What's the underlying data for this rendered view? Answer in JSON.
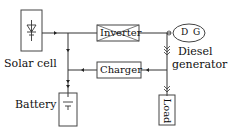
{
  "diagram": {
    "type": "hybrid power system block diagram",
    "components": {
      "solar_cell": {
        "label": "Solar cell"
      },
      "inverter": {
        "label": "Inverter"
      },
      "charger": {
        "label": "Charger"
      },
      "diesel_generator": {
        "symbol": "D G",
        "label_line1": "Diesel",
        "label_line2": "generator"
      },
      "battery": {
        "label": "Battery"
      },
      "load": {
        "label": "Load"
      }
    },
    "connections": [
      {
        "from": "solar_cell",
        "to": "inverter"
      },
      {
        "from": "solar_cell",
        "to": "battery"
      },
      {
        "from": "inverter",
        "to": "diesel_generator"
      },
      {
        "from": "diesel_generator",
        "to": "charger"
      },
      {
        "from": "diesel_generator",
        "to": "load"
      },
      {
        "from": "charger",
        "to": "battery"
      }
    ],
    "colors": {
      "line": "#333333",
      "background": "#ffffff"
    }
  }
}
